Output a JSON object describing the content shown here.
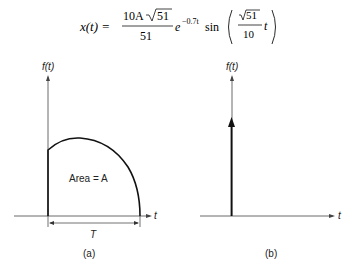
{
  "equation": {
    "lhs": "x(t) =",
    "numerator": "10A",
    "sqrt_arg": "51",
    "denominator": "51",
    "exp_base": "e",
    "exponent": "−0.7t",
    "func": "sin",
    "inner_sqrt": "51",
    "inner_den": "10",
    "inner_var": "t"
  },
  "figure_a": {
    "y_axis_label": "f(t)",
    "x_axis_label": "t",
    "area_label": "Area = A",
    "width_label": "T",
    "caption": "(a)"
  },
  "figure_b": {
    "y_axis_label": "f(t)",
    "x_axis_label": "t",
    "caption": "(b)"
  }
}
